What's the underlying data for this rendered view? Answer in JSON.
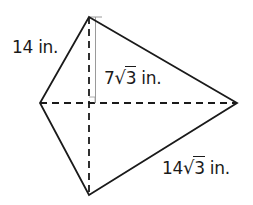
{
  "figure": {
    "type": "kite-with-diagonals",
    "vertices": {
      "top": [
        89,
        17
      ],
      "left": [
        40,
        103
      ],
      "right": [
        237,
        103
      ],
      "bottom": [
        89,
        195
      ],
      "center": [
        89,
        103
      ]
    },
    "stroke_color": "#1a1a1a",
    "height_marker_color": "#9a9a9a"
  },
  "labels": {
    "side_top_left": {
      "value": "14",
      "unit": " in."
    },
    "height": {
      "coefficient": "7",
      "radicand": "3",
      "unit": " in."
    },
    "side_bottom_right": {
      "coefficient": "14",
      "radicand": "3",
      "unit": " in."
    }
  }
}
